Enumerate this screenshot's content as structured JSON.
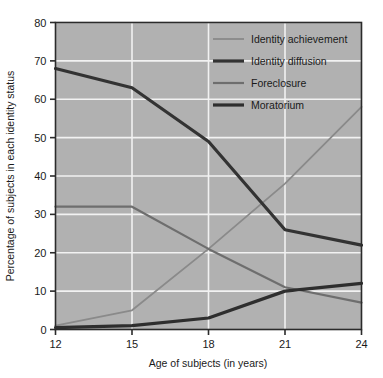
{
  "chart_data": {
    "type": "line",
    "title": "",
    "xlabel": "Age of subjects (in years)",
    "ylabel": "Percentage of subjects in each identity status",
    "x": [
      12,
      15,
      18,
      21,
      24
    ],
    "xtick_labels": [
      "12",
      "15",
      "18",
      "21",
      "24"
    ],
    "ytick_labels": [
      "0",
      "10",
      "20",
      "30",
      "40",
      "50",
      "60",
      "70",
      "80"
    ],
    "xlim": [
      12,
      24
    ],
    "ylim": [
      0,
      80
    ],
    "ytick_step": 10,
    "grid": "white horizontal and vertical gridlines",
    "legend_position": "top-right inside plot area",
    "plot_background": "#b1b1b1",
    "gridline_color": "#f2f2f2",
    "axis_color": "#2b2b2b",
    "series": [
      {
        "name": "Identity achievement",
        "values": [
          1,
          5,
          21,
          38,
          58
        ],
        "color": "#8a8a8a",
        "width": 1.8
      },
      {
        "name": "Identity diffusion",
        "values": [
          68,
          63,
          49,
          26,
          22
        ],
        "color": "#333333",
        "width": 3.2
      },
      {
        "name": "Foreclosure",
        "values": [
          32,
          32,
          21,
          11,
          7
        ],
        "color": "#6e6e6e",
        "width": 2.2
      },
      {
        "name": "Moratorium",
        "values": [
          0.5,
          1,
          3,
          10,
          12
        ],
        "color": "#2e2e2e",
        "width": 3.2
      }
    ]
  },
  "legend": {
    "items": [
      {
        "label": "Identity achievement"
      },
      {
        "label": "Identity diffusion"
      },
      {
        "label": "Foreclosure"
      },
      {
        "label": "Moratorium"
      }
    ]
  }
}
